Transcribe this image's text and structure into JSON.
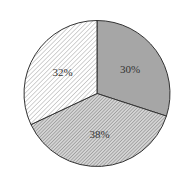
{
  "chart_data": {
    "type": "pie",
    "title": "",
    "categories": [
      "Slice A",
      "Slice B",
      "Slice C"
    ],
    "values": [
      30,
      38,
      32
    ],
    "labels": [
      "30%",
      "38%",
      "32%"
    ],
    "start_angle_deg": 90,
    "direction": "clockwise",
    "fills": [
      {
        "style": "solid",
        "color": "#a6a6a6"
      },
      {
        "style": "dense-diagonal-hatch",
        "color": "#8c8c8c",
        "background": "#d9d9d9"
      },
      {
        "style": "sparse-diagonal-hatch",
        "color": "#9a9a9a",
        "background": "#ffffff"
      }
    ],
    "legend": null,
    "grid": false
  }
}
